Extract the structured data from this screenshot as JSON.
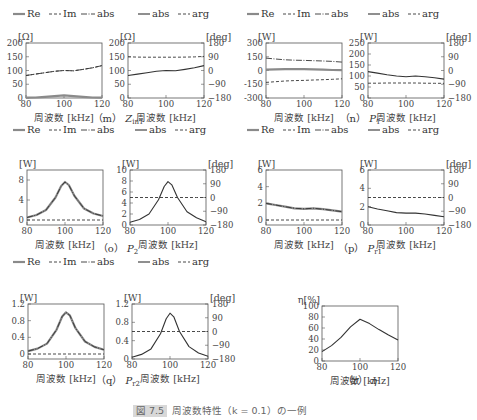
{
  "figure_caption": "図 7.5  Z_in1 周波数特性 (k = 0.1) の一例",
  "figure_caption_parts": {
    "label": "図 7.5",
    "text": "周波数特性（k = 0.1）の一例"
  },
  "xlabel": "周波数 [kHz]",
  "legend_complex": [
    "Re",
    "Im",
    "abs"
  ],
  "legend_polar": [
    "abs",
    "arg"
  ],
  "panels": [
    {
      "id": "m",
      "caption_prefix": "（m）",
      "caption_sym": "Z",
      "caption_sub": "in1"
    },
    {
      "id": "n",
      "caption_prefix": "（n）",
      "caption_sym": "P",
      "caption_sub": "1"
    },
    {
      "id": "o",
      "caption_prefix": "（o）",
      "caption_sym": "P",
      "caption_sub": "2"
    },
    {
      "id": "p",
      "caption_prefix": "（p）",
      "caption_sym": "P",
      "caption_sub": "r1"
    },
    {
      "id": "q",
      "caption_prefix": "（q）",
      "caption_sym": "P",
      "caption_sub": "r2"
    },
    {
      "id": "r",
      "caption_prefix": "（r）",
      "caption_sym": "η",
      "caption_sub": ""
    }
  ],
  "chart_data": [
    {
      "id": "m-left",
      "type": "line",
      "title": "Z_in1 (Re/Im/abs)",
      "unit": "[Ω]",
      "xlabel": "周波数 [kHz]",
      "xlim": [
        80,
        120
      ],
      "xticks": [
        80,
        100,
        120
      ],
      "ylim": [
        0,
        200
      ],
      "yticks": [
        0,
        50,
        100,
        150,
        200
      ],
      "x": [
        80,
        85,
        90,
        95,
        100,
        105,
        110,
        115,
        120
      ],
      "series": [
        {
          "name": "Re",
          "style": "solid-gray",
          "values": [
            1,
            2,
            4,
            7,
            10,
            7,
            4,
            2,
            1
          ]
        },
        {
          "name": "Im",
          "style": "dashed",
          "values": [
            82,
            87,
            92,
            97,
            100,
            99,
            104,
            110,
            118
          ]
        },
        {
          "name": "abs",
          "style": "dashdot",
          "values": [
            82,
            87,
            92,
            97,
            100,
            99,
            104,
            110,
            118
          ]
        }
      ]
    },
    {
      "id": "m-right",
      "type": "line",
      "title": "Z_in1 (abs/arg)",
      "unit": "[Ω]",
      "unit_right": "[deg]",
      "xlim": [
        80,
        120
      ],
      "xticks": [
        80,
        100,
        120
      ],
      "ylim": [
        0,
        200
      ],
      "yticks": [
        0,
        50,
        100,
        150,
        200
      ],
      "y2lim": [
        -180,
        180
      ],
      "y2ticks": [
        -180,
        -90,
        0,
        90,
        180
      ],
      "x": [
        80,
        85,
        90,
        95,
        100,
        105,
        110,
        115,
        120
      ],
      "series": [
        {
          "name": "abs",
          "style": "solid",
          "axis": "left",
          "values": [
            82,
            87,
            92,
            97,
            100,
            99,
            104,
            110,
            118
          ]
        },
        {
          "name": "arg",
          "style": "dashed",
          "axis": "right",
          "values": [
            90,
            88,
            87,
            87,
            87,
            87,
            88,
            89,
            92
          ]
        }
      ]
    },
    {
      "id": "n-left",
      "type": "line",
      "title": "P1 (Re/Im/abs)",
      "unit": "[W]",
      "xlim": [
        80,
        120
      ],
      "xticks": [
        80,
        100,
        120
      ],
      "ylim": [
        -300,
        300
      ],
      "yticks": [
        -300,
        -150,
        0,
        150,
        300
      ],
      "x": [
        80,
        85,
        90,
        95,
        100,
        105,
        110,
        115,
        120
      ],
      "series": [
        {
          "name": "Re",
          "style": "solid-gray",
          "values": [
            10,
            12,
            14,
            15,
            15,
            13,
            10,
            6,
            4
          ]
        },
        {
          "name": "Im",
          "style": "dashed",
          "values": [
            -130,
            -122,
            -115,
            -110,
            -108,
            -104,
            -100,
            -96,
            -90
          ]
        },
        {
          "name": "abs",
          "style": "dashdot",
          "values": [
            135,
            125,
            117,
            112,
            110,
            107,
            104,
            99,
            92
          ]
        }
      ]
    },
    {
      "id": "n-right",
      "type": "line",
      "title": "P1 (abs/arg)",
      "unit": "[W]",
      "unit_right": "[deg]",
      "xlim": [
        80,
        120
      ],
      "xticks": [
        80,
        100,
        120
      ],
      "ylim": [
        0,
        250
      ],
      "yticks": [
        0,
        50,
        100,
        150,
        200,
        250
      ],
      "y2lim": [
        -180,
        180
      ],
      "y2ticks": [
        -180,
        -90,
        0,
        90,
        180
      ],
      "x": [
        80,
        85,
        90,
        95,
        100,
        105,
        110,
        115,
        120
      ],
      "series": [
        {
          "name": "abs",
          "style": "solid",
          "axis": "left",
          "values": [
            120,
            113,
            106,
            100,
            97,
            100,
            97,
            92,
            86
          ]
        },
        {
          "name": "arg",
          "style": "dashed",
          "axis": "right",
          "values": [
            -83,
            -83,
            -82,
            -82,
            -82,
            -82,
            -83,
            -84,
            -84
          ]
        }
      ]
    },
    {
      "id": "o-left",
      "type": "line",
      "title": "P2 (Re/Im/abs)",
      "unit": "[W]",
      "xlim": [
        80,
        120
      ],
      "xticks": [
        80,
        100,
        120
      ],
      "ylim": [
        -1,
        10
      ],
      "yticks": [
        0,
        4,
        8
      ],
      "x": [
        80,
        85,
        90,
        95,
        98,
        100,
        102,
        105,
        110,
        115,
        120
      ],
      "series": [
        {
          "name": "Re",
          "style": "solid-gray",
          "values": [
            0.5,
            1.0,
            2.0,
            4.5,
            6.8,
            7.6,
            7.0,
            4.8,
            2.3,
            1.3,
            0.8
          ]
        },
        {
          "name": "Im",
          "style": "dashed",
          "values": [
            0,
            0,
            0,
            0,
            0,
            0,
            0,
            0,
            0,
            0,
            0
          ]
        },
        {
          "name": "abs",
          "style": "dashdot",
          "values": [
            0.5,
            1.0,
            2.0,
            4.5,
            6.8,
            7.6,
            7.0,
            4.8,
            2.3,
            1.3,
            0.8
          ]
        }
      ]
    },
    {
      "id": "o-right",
      "type": "line",
      "title": "P2 (abs/arg)",
      "unit": "[W]",
      "unit_right": "[deg]",
      "xlim": [
        80,
        120
      ],
      "xticks": [
        80,
        100,
        120
      ],
      "ylim": [
        0,
        10
      ],
      "yticks": [
        0,
        2,
        4,
        6,
        8,
        10
      ],
      "y2lim": [
        -180,
        180
      ],
      "y2ticks": [
        -180,
        -90,
        0,
        90,
        180
      ],
      "x": [
        80,
        85,
        90,
        95,
        98,
        100,
        102,
        105,
        110,
        115,
        120
      ],
      "series": [
        {
          "name": "abs",
          "style": "solid",
          "axis": "left",
          "values": [
            0.5,
            1.0,
            2.0,
            4.6,
            7.0,
            7.9,
            7.3,
            5.0,
            2.4,
            1.3,
            0.6
          ]
        },
        {
          "name": "arg",
          "style": "dashed",
          "axis": "right",
          "values": [
            0,
            0,
            0,
            0,
            0,
            0,
            0,
            0,
            0,
            0,
            0
          ]
        }
      ]
    },
    {
      "id": "p-left",
      "type": "line",
      "title": "Pr1 (Re/Im/abs)",
      "unit": "[W]",
      "xlim": [
        80,
        120
      ],
      "xticks": [
        80,
        100,
        120
      ],
      "ylim": [
        -0.6,
        6
      ],
      "yticks": [
        0,
        2,
        4,
        6
      ],
      "x": [
        80,
        85,
        90,
        95,
        100,
        105,
        110,
        115,
        120
      ],
      "series": [
        {
          "name": "Re",
          "style": "solid-gray",
          "values": [
            2.0,
            1.8,
            1.6,
            1.4,
            1.35,
            1.4,
            1.3,
            1.15,
            1.0
          ]
        },
        {
          "name": "Im",
          "style": "dashed",
          "values": [
            0,
            0,
            0,
            0,
            0,
            0,
            0,
            0,
            0
          ]
        },
        {
          "name": "abs",
          "style": "dashdot",
          "values": [
            2.0,
            1.8,
            1.6,
            1.4,
            1.35,
            1.4,
            1.3,
            1.15,
            1.0
          ]
        }
      ]
    },
    {
      "id": "p-right",
      "type": "line",
      "title": "Pr1 (abs/arg)",
      "unit": "[W]",
      "unit_right": "[deg]",
      "xlim": [
        80,
        120
      ],
      "xticks": [
        80,
        100,
        120
      ],
      "ylim": [
        0,
        6
      ],
      "yticks": [
        0,
        2,
        4,
        6
      ],
      "y2lim": [
        -180,
        180
      ],
      "y2ticks": [
        -180,
        -90,
        0,
        90,
        180
      ],
      "x": [
        80,
        85,
        90,
        95,
        100,
        105,
        110,
        115,
        120
      ],
      "series": [
        {
          "name": "abs",
          "style": "solid",
          "axis": "left",
          "values": [
            2.0,
            1.75,
            1.55,
            1.35,
            1.3,
            1.3,
            1.2,
            1.05,
            0.9
          ]
        },
        {
          "name": "arg",
          "style": "dashed",
          "axis": "right",
          "values": [
            0,
            0,
            0,
            0,
            0,
            0,
            0,
            0,
            0
          ]
        }
      ]
    },
    {
      "id": "q-left",
      "type": "line",
      "title": "Pr2 (Re/Im/abs)",
      "unit": "[W]",
      "xlim": [
        80,
        120
      ],
      "xticks": [
        80,
        100,
        120
      ],
      "ylim": [
        -0.12,
        1.2
      ],
      "yticks": [
        0,
        0.4,
        0.8,
        1.2
      ],
      "x": [
        80,
        85,
        90,
        95,
        98,
        100,
        102,
        105,
        110,
        115,
        120
      ],
      "series": [
        {
          "name": "Re",
          "style": "solid-gray",
          "values": [
            0.07,
            0.13,
            0.25,
            0.58,
            0.9,
            1.0,
            0.93,
            0.62,
            0.3,
            0.17,
            0.1
          ]
        },
        {
          "name": "Im",
          "style": "dashed",
          "values": [
            0,
            0,
            0,
            0,
            0,
            0,
            0,
            0,
            0,
            0,
            0
          ]
        },
        {
          "name": "abs",
          "style": "dashdot",
          "values": [
            0.07,
            0.13,
            0.25,
            0.58,
            0.9,
            1.0,
            0.93,
            0.62,
            0.3,
            0.17,
            0.1
          ]
        }
      ]
    },
    {
      "id": "q-right",
      "type": "line",
      "title": "Pr2 (abs/arg)",
      "unit": "[W]",
      "unit_right": "[deg]",
      "xlim": [
        80,
        120
      ],
      "xticks": [
        80,
        100,
        120
      ],
      "ylim": [
        0,
        1.2
      ],
      "yticks": [
        0,
        0.4,
        0.8,
        1.2
      ],
      "y2lim": [
        -180,
        180
      ],
      "y2ticks": [
        -180,
        -90,
        0,
        90,
        180
      ],
      "x": [
        80,
        85,
        90,
        95,
        98,
        100,
        102,
        105,
        110,
        115,
        120
      ],
      "series": [
        {
          "name": "abs",
          "style": "solid",
          "axis": "left",
          "values": [
            0.04,
            0.1,
            0.22,
            0.55,
            0.88,
            1.0,
            0.92,
            0.6,
            0.27,
            0.13,
            0.06
          ]
        },
        {
          "name": "arg",
          "style": "dashed",
          "axis": "right",
          "values": [
            0,
            0,
            0,
            0,
            0,
            0,
            0,
            0,
            0,
            0,
            0
          ]
        }
      ]
    },
    {
      "id": "r",
      "type": "line",
      "title": "η",
      "unit": "η[%]",
      "xlim": [
        80,
        120
      ],
      "xticks": [
        80,
        100,
        120
      ],
      "ylim": [
        0,
        100
      ],
      "yticks": [
        0,
        20,
        40,
        60,
        80,
        100
      ],
      "x": [
        80,
        85,
        90,
        95,
        100,
        105,
        110,
        115,
        120
      ],
      "series": [
        {
          "name": "η",
          "style": "solid",
          "values": [
            17,
            28,
            43,
            62,
            76,
            68,
            57,
            47,
            38
          ]
        }
      ]
    }
  ]
}
